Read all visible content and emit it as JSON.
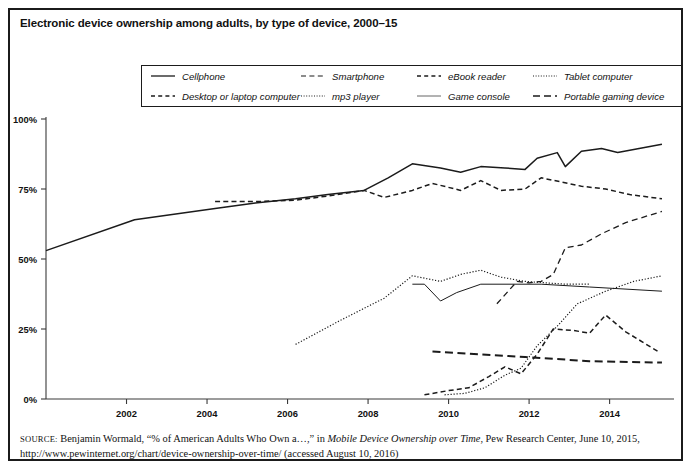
{
  "figure": {
    "title": "Electronic device ownership among adults, by type of device, 2000–15",
    "source_label": "SOURCE:",
    "source_text_1": " Benjamin Wormald, “% of American Adults Who Own a…,” in ",
    "source_italic": "Mobile Device Ownership over Time",
    "source_text_2": ", Pew Research Center, June 10, 2015,",
    "source_text_3": "http://www.pewinternet.org/chart/device-ownership-over-time/ (accessed August 10, 2016)"
  },
  "legend": {
    "row1": [
      {
        "label": "Cellphone",
        "style": "solid"
      },
      {
        "label": "Smartphone",
        "style": "dash-long"
      },
      {
        "label": "eBook reader",
        "style": "dash-med"
      },
      {
        "label": "Tablet computer",
        "style": "dotted"
      }
    ],
    "row2": [
      {
        "label": "Desktop or laptop computer",
        "style": "dash-med"
      },
      {
        "label": "mp3 player",
        "style": "dotted"
      },
      {
        "label": "Game console",
        "style": "thin-solid"
      },
      {
        "label": "Portable gaming device",
        "style": "dash-wide"
      }
    ]
  },
  "chart_data": {
    "type": "line",
    "title": "Electronic device ownership among adults, by type of device, 2000–15",
    "xlabel": "",
    "ylabel": "",
    "xlim": [
      2000,
      2015.5
    ],
    "ylim": [
      0,
      100
    ],
    "grid": false,
    "legend_position": "top",
    "y_ticks": [
      0,
      25,
      50,
      75,
      100
    ],
    "y_tick_labels": [
      "0%",
      "25%",
      "50%",
      "75%",
      "100%"
    ],
    "x_ticks": [
      2002,
      2004,
      2006,
      2008,
      2010,
      2012,
      2014
    ],
    "x_tick_labels": [
      "2002",
      "2004",
      "2006",
      "2008",
      "2010",
      "2012",
      "2014"
    ],
    "series": [
      {
        "name": "Cellphone",
        "style": "solid",
        "x": [
          2000.0,
          2002.2,
          2004.2,
          2005.2,
          2006.2,
          2007.0,
          2007.9,
          2008.5,
          2009.1,
          2009.8,
          2010.3,
          2010.8,
          2011.4,
          2011.9,
          2012.2,
          2012.7,
          2012.9,
          2013.3,
          2013.8,
          2014.2,
          2015.3
        ],
        "y": [
          53,
          64,
          68,
          70,
          71.5,
          73,
          74.5,
          79,
          84,
          82.5,
          81,
          83,
          82.5,
          82,
          86,
          88,
          83,
          88.5,
          89.5,
          88,
          91
        ]
      },
      {
        "name": "Desktop or laptop computer",
        "style": "dash-med",
        "x": [
          2004.2,
          2005.2,
          2006.2,
          2007.0,
          2007.9,
          2008.4,
          2009.1,
          2009.6,
          2010.3,
          2010.8,
          2011.3,
          2011.9,
          2012.3,
          2012.8,
          2013.3,
          2013.9,
          2014.5,
          2015.3
        ],
        "y": [
          70.5,
          70.5,
          71,
          72.5,
          74.5,
          72,
          74.5,
          77,
          74.5,
          78,
          74.5,
          75,
          79,
          77.5,
          76,
          75,
          73,
          71.5
        ]
      },
      {
        "name": "Smartphone",
        "style": "dash-long",
        "x": [
          2011.2,
          2011.7,
          2012.0,
          2012.3,
          2012.6,
          2012.9,
          2013.3,
          2013.8,
          2014.4,
          2015.3
        ],
        "y": [
          34,
          42,
          41.5,
          42,
          44.5,
          54,
          55,
          59,
          63,
          67
        ]
      },
      {
        "name": "mp3 player",
        "style": "dotted",
        "x": [
          2006.2,
          2007.3,
          2008.4,
          2009.1,
          2009.8,
          2010.3,
          2010.8,
          2011.3,
          2011.9,
          2012.4,
          2012.9,
          2013.5
        ],
        "y": [
          19.5,
          28,
          36,
          44,
          42,
          44.5,
          46,
          43.5,
          42,
          41.5,
          41,
          41
        ]
      },
      {
        "name": "Game console",
        "style": "thin-solid",
        "x": [
          2009.1,
          2009.4,
          2009.8,
          2010.2,
          2010.8,
          2012.3,
          2013.5,
          2015.3
        ],
        "y": [
          41,
          41,
          35,
          38,
          41,
          41,
          40,
          38.5
        ]
      },
      {
        "name": "Tablet computer",
        "style": "dotted",
        "x": [
          2009.9,
          2010.4,
          2010.9,
          2011.4,
          2011.8,
          2012.2,
          2012.7,
          2013.2,
          2013.9,
          2014.6,
          2015.3
        ],
        "y": [
          1.5,
          2,
          4,
          8.5,
          11,
          19,
          26,
          34,
          38.5,
          42,
          44
        ]
      },
      {
        "name": "eBook reader",
        "style": "dash-med",
        "x": [
          2009.4,
          2010.0,
          2010.5,
          2011.0,
          2011.4,
          2011.8,
          2012.2,
          2012.6,
          2013.1,
          2013.5,
          2013.9,
          2014.4,
          2015.2
        ],
        "y": [
          1.5,
          3,
          4,
          8,
          11.5,
          9,
          16,
          25,
          24.5,
          23.5,
          30,
          24,
          17
        ]
      },
      {
        "name": "Portable gaming device",
        "style": "dash-wide",
        "x": [
          2009.6,
          2011.9,
          2013.5,
          2015.3
        ],
        "y": [
          17,
          15,
          13.5,
          13
        ]
      }
    ]
  }
}
